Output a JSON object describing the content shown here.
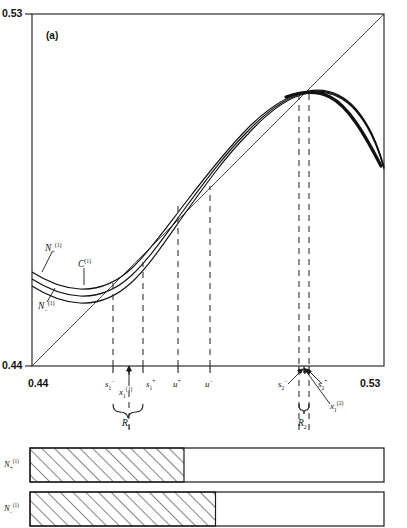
{
  "figure": {
    "panel_label": "(a)",
    "type": "scientific-diagram"
  },
  "chart_data": {
    "type": "line",
    "title": "(a)",
    "xlabel": "",
    "ylabel": "",
    "xlim": [
      0.44,
      0.53
    ],
    "ylim": [
      0.44,
      0.53
    ],
    "grid": false,
    "legend": "inline-curve-labels",
    "axis_ticks": {
      "x": [
        "0.44",
        "0.53"
      ],
      "y": [
        "0.44",
        "0.53"
      ]
    },
    "annotations": [
      {
        "name": "diagonal",
        "note": "45-degree identity line from (0.44,0.44) to (0.53,0.53)"
      },
      {
        "name": "unimodal-maps",
        "note": "three nearly coincident unimodal curves N+(1), C(1), N-(1)"
      }
    ],
    "series": [
      {
        "name": "N_+^(1)",
        "label_html": "N<sub>+</sub><sup>(1)</sup>",
        "x": [
          0.44,
          0.4445,
          0.449,
          0.4535,
          0.458,
          0.4625,
          0.467,
          0.4715,
          0.476,
          0.4805,
          0.485,
          0.4895,
          0.494,
          0.4985,
          0.503,
          0.5075,
          0.512,
          0.5165,
          0.521,
          0.5255,
          0.53
        ],
        "y": [
          0.47,
          0.4683,
          0.4672,
          0.4668,
          0.4672,
          0.4686,
          0.4712,
          0.475,
          0.48,
          0.4859,
          0.4923,
          0.4988,
          0.5046,
          0.5094,
          0.5127,
          0.5142,
          0.514,
          0.512,
          0.508,
          0.5018,
          0.4934
        ]
      },
      {
        "name": "C^(1)",
        "label_html": "C<sup>(1)</sup>",
        "x": [
          0.44,
          0.4445,
          0.449,
          0.4535,
          0.458,
          0.4625,
          0.467,
          0.4715,
          0.476,
          0.4805,
          0.485,
          0.4895,
          0.494,
          0.4985,
          0.503,
          0.5075,
          0.512,
          0.5165,
          0.521,
          0.5255,
          0.53
        ],
        "y": [
          0.4688,
          0.4671,
          0.466,
          0.4656,
          0.466,
          0.4675,
          0.4702,
          0.4742,
          0.4794,
          0.4854,
          0.4919,
          0.4985,
          0.5043,
          0.5091,
          0.5124,
          0.514,
          0.5139,
          0.512,
          0.508,
          0.5018,
          0.4934
        ]
      },
      {
        "name": "N_-^(1)",
        "label_html": "N<sub>-</sub><sup>(1)</sup>",
        "x": [
          0.44,
          0.4445,
          0.449,
          0.4535,
          0.458,
          0.4625,
          0.467,
          0.4715,
          0.476,
          0.4805,
          0.485,
          0.4895,
          0.494,
          0.4985,
          0.503,
          0.5075,
          0.512,
          0.5165,
          0.521,
          0.5255,
          0.53
        ],
        "y": [
          0.4676,
          0.4659,
          0.4648,
          0.4644,
          0.4649,
          0.4665,
          0.4693,
          0.4734,
          0.4788,
          0.4849,
          0.4915,
          0.4982,
          0.5041,
          0.5089,
          0.5123,
          0.5139,
          0.5138,
          0.5119,
          0.508,
          0.5018,
          0.4934
        ]
      },
      {
        "name": "identity",
        "label_html": "",
        "x": [
          0.44,
          0.53
        ],
        "y": [
          0.44,
          0.53
        ]
      }
    ],
    "markers": [
      {
        "id": "s1m",
        "x": 0.469,
        "label": "s₁⁻"
      },
      {
        "id": "x11",
        "x": 0.473,
        "label": "x₁⁽¹⁾"
      },
      {
        "id": "s1p",
        "x": 0.4765,
        "label": "s₁⁺"
      },
      {
        "id": "up",
        "x": 0.4855,
        "label": "u⁺"
      },
      {
        "id": "um",
        "x": 0.4935,
        "label": "u⁻"
      },
      {
        "id": "s2m",
        "x": 0.5105,
        "label": "s₂⁻"
      },
      {
        "id": "x12",
        "x": 0.5118,
        "label": "x₁⁽²⁾"
      },
      {
        "id": "s2p",
        "x": 0.5132,
        "label": "s₂⁺"
      }
    ],
    "regions": [
      {
        "id": "R1",
        "label": "R₁",
        "from": 0.469,
        "to": 0.4765
      },
      {
        "id": "R2",
        "label": "R₂",
        "from": 0.5105,
        "to": 0.5132
      }
    ]
  },
  "axis": {
    "y_top": "0.53",
    "y_bottom": "0.44",
    "x_left": "0.44",
    "x_right": "0.53"
  },
  "curve_labels": {
    "n_plus": {
      "base": "N",
      "sub": "+",
      "sup": "(1)"
    },
    "c": {
      "base": "C",
      "sub": "",
      "sup": "(1)"
    },
    "n_minus": {
      "base": "N",
      "sub": "−",
      "sup": "(1)"
    }
  },
  "tick_labels": {
    "s1_minus": {
      "base": "s",
      "sub": "1",
      "sup": "−"
    },
    "x1_1": {
      "base": "x",
      "sub": "1",
      "sup": "(1)"
    },
    "s1_plus": {
      "base": "s",
      "sub": "1",
      "sup": "+"
    },
    "u_plus": {
      "base": "u",
      "sub": "",
      "sup": "+"
    },
    "u_minus": {
      "base": "u",
      "sub": "",
      "sup": "−"
    },
    "s2_minus": {
      "base": "s",
      "sub": "2",
      "sup": "−"
    },
    "s2_plus": {
      "base": "s",
      "sub": "2",
      "sup": "+"
    },
    "x1_2": {
      "base": "x",
      "sub": "1",
      "sup": "(2)"
    }
  },
  "region_labels": {
    "r1": {
      "base": "R",
      "sub": "1"
    },
    "r2": {
      "base": "R",
      "sub": "2"
    }
  },
  "bars": [
    {
      "id": "bar-n-plus",
      "label": {
        "base": "N",
        "sub": "+",
        "sup": "(1)"
      },
      "fill_fraction": 0.435,
      "hatch": "diagonal"
    },
    {
      "id": "bar-n-minus",
      "label": {
        "base": "N",
        "sub": "−",
        "sup": "(1)"
      },
      "fill_fraction": 0.524,
      "hatch": "diagonal"
    }
  ],
  "colors": {
    "ink": "#1a1a1a",
    "curve": "#111111",
    "dash": "#444444",
    "background": "#ffffff"
  }
}
